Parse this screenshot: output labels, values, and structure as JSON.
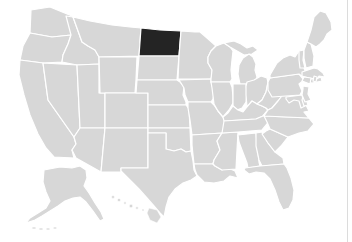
{
  "map": {
    "type": "usa-states-choropleth",
    "highlighted_state": "North Dakota",
    "regions_shown": [
      "Contiguous United States",
      "Alaska inset",
      "Hawaii inset"
    ],
    "labels_visible": false,
    "colors": {
      "background": "#ffffff",
      "state_fill": "#d7d7d7",
      "state_border": "#ffffff",
      "highlight_fill": "#242424",
      "frame_line": "#dcdcdc"
    }
  }
}
